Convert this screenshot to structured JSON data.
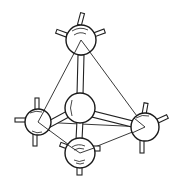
{
  "diagram": {
    "type": "tetrahedral-molecular-model",
    "style": "line-drawing",
    "colors": {
      "line": "#222222",
      "background": "#ffffff"
    },
    "atoms": [
      {
        "id": "top",
        "x": 81,
        "y": 40,
        "r": 15
      },
      {
        "id": "center",
        "x": 80,
        "y": 108,
        "r": 15
      },
      {
        "id": "left",
        "x": 38,
        "y": 122,
        "r": 13
      },
      {
        "id": "right",
        "x": 145,
        "y": 127,
        "r": 14
      },
      {
        "id": "bottom",
        "x": 80,
        "y": 153,
        "r": 15
      }
    ],
    "tetrahedron_edges": [
      [
        "top",
        "left"
      ],
      [
        "top",
        "right"
      ],
      [
        "top",
        "bottom"
      ],
      [
        "left",
        "right"
      ],
      [
        "left",
        "bottom"
      ],
      [
        "right",
        "bottom"
      ]
    ],
    "bonds": [
      [
        "center",
        "top"
      ],
      [
        "center",
        "left"
      ],
      [
        "center",
        "right"
      ],
      [
        "center",
        "bottom"
      ]
    ]
  }
}
